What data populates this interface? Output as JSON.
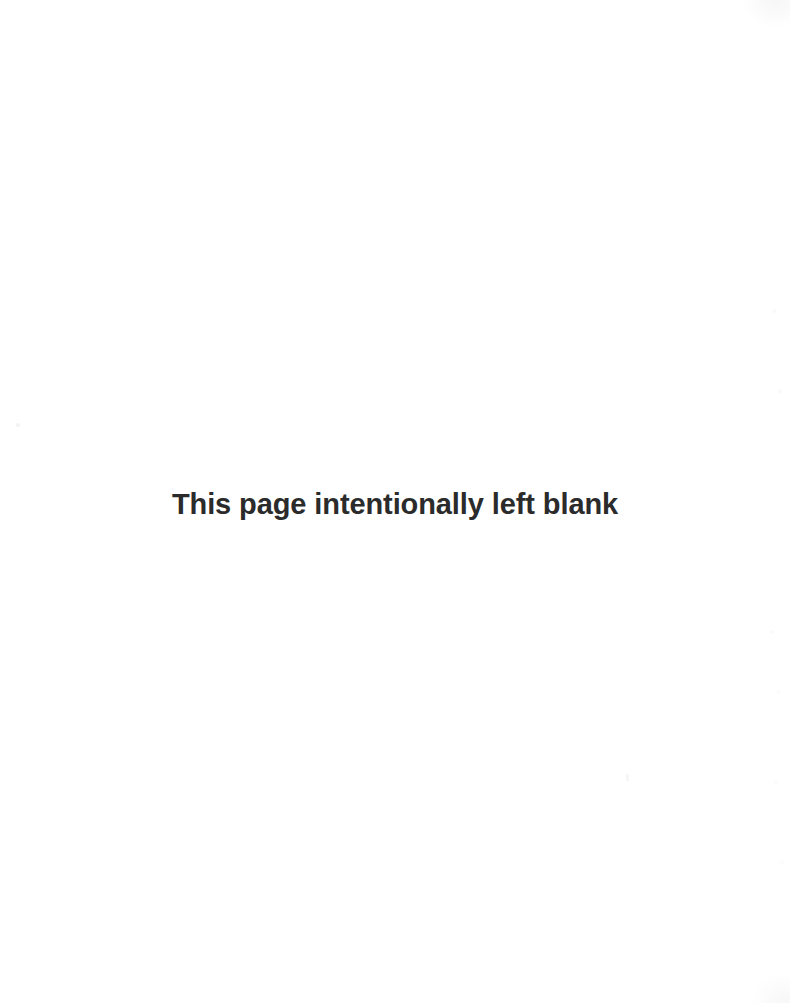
{
  "page": {
    "background_color": "#ffffff",
    "width": 790,
    "height": 1003,
    "notice": {
      "text": "This page intentionally left blank",
      "color": "#2b2b2b"
    }
  }
}
